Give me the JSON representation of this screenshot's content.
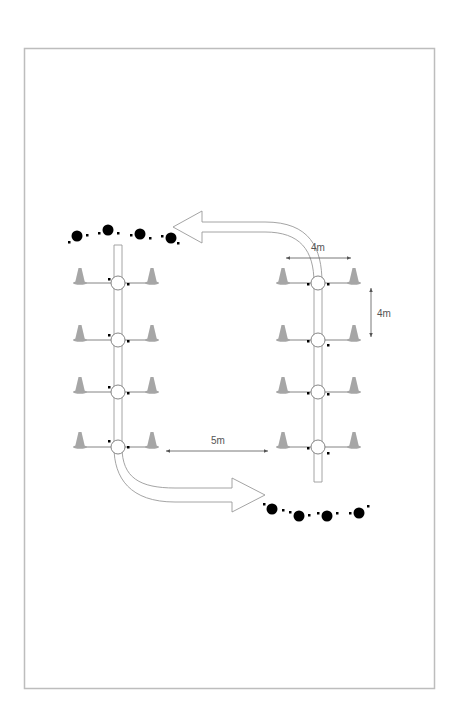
{
  "diagram": {
    "type": "drill-layout",
    "colors": {
      "frame": "#bdbdbd",
      "cone": "#a6a6a6",
      "lane_stroke": "#9a9a9a",
      "line": "#777777",
      "player": "#000000",
      "label": "#555555"
    },
    "labels": {
      "horizontal_spacing": "4m",
      "vertical_spacing": "4m",
      "lane_gap": "5m"
    },
    "lanes": [
      {
        "name": "left",
        "rows": 4
      },
      {
        "name": "right",
        "rows": 4
      }
    ],
    "arrows": [
      {
        "name": "top-return-arrow",
        "direction": "left"
      },
      {
        "name": "bottom-exit-arrow",
        "direction": "right"
      }
    ],
    "player_groups": [
      {
        "name": "top-waiting-players",
        "count": 4
      },
      {
        "name": "bottom-finished-players",
        "count": 4
      }
    ]
  }
}
